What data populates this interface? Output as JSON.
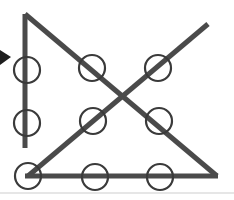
{
  "figure": {
    "canvas": {
      "width": 234,
      "height": 200
    },
    "background_color": "#ffffff",
    "stroke_color": "#4a4a4a",
    "stroke_color_dark": "#3d3d3d",
    "circle_stroke_color": "#3a3a3a",
    "baseline_color": "#e6e6e6",
    "stroke_width": 5,
    "circle_stroke_width": 2.2,
    "circle_radius": 13,
    "segments": [
      {
        "name": "vertical-line",
        "x1": 25,
        "y1": 14,
        "x2": 25,
        "y2": 148
      },
      {
        "name": "descending-diagonal",
        "x1": 25,
        "y1": 14,
        "x2": 217,
        "y2": 176
      },
      {
        "name": "ascending-diagonal",
        "x1": 28,
        "y1": 176,
        "x2": 208,
        "y2": 24
      },
      {
        "name": "horizontal-baseline",
        "x1": 25,
        "y1": 176,
        "x2": 218,
        "y2": 176
      }
    ],
    "circles": [
      {
        "name": "circle-left-upper",
        "cx": 27,
        "cy": 70
      },
      {
        "name": "circle-left-lower",
        "cx": 27,
        "cy": 123
      },
      {
        "name": "circle-mid-upper-left",
        "cx": 92,
        "cy": 68
      },
      {
        "name": "circle-mid-upper-right",
        "cx": 158,
        "cy": 68
      },
      {
        "name": "circle-mid-lower-left",
        "cx": 93,
        "cy": 121
      },
      {
        "name": "circle-mid-lower-right",
        "cx": 159,
        "cy": 121
      },
      {
        "name": "circle-bottom-left",
        "cx": 28,
        "cy": 176
      },
      {
        "name": "circle-bottom-center",
        "cx": 95,
        "cy": 177
      },
      {
        "name": "circle-bottom-right",
        "cx": 160,
        "cy": 177
      }
    ],
    "arrow_marker": {
      "name": "left-arrowhead",
      "points": "0,50 11,57 0,65",
      "color": "#1e1e1e"
    },
    "footer_rule": {
      "name": "bottom-rule",
      "x1": 0,
      "y1": 193,
      "x2": 234,
      "y2": 193
    }
  }
}
